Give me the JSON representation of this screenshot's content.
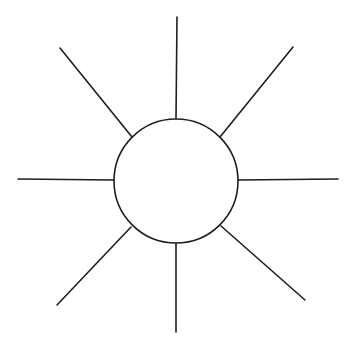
{
  "canvas": {
    "width": 348,
    "height": 350,
    "background_color": "#ffffff",
    "stroke_color": "#1f1f1f",
    "stroke_width": 1.6,
    "title": "Sun symbol line drawing"
  },
  "figure": {
    "name": "sun",
    "ray_count": 8
  },
  "chart_data": {
    "type": "scatter",
    "subtitle": "",
    "xlabel": "",
    "ylabel": "",
    "xlim": [
      0,
      348
    ],
    "ylim": [
      0,
      350
    ],
    "grid": false,
    "legend": "none",
    "circle": {
      "cx": 176,
      "cy": 181,
      "r": 62,
      "fill": "#ffffff",
      "stroke": "#1f1f1f"
    },
    "rays": [
      {
        "name": "ray-n",
        "angle_deg": 90,
        "x1": 176,
        "y1": 119,
        "x2": 177,
        "y2": 17
      },
      {
        "name": "ray-ne",
        "angle_deg": 45,
        "x1": 220,
        "y1": 137,
        "x2": 293,
        "y2": 47
      },
      {
        "name": "ray-e",
        "angle_deg": 0,
        "x1": 238,
        "y1": 180,
        "x2": 338,
        "y2": 179
      },
      {
        "name": "ray-se",
        "angle_deg": -45,
        "x1": 221,
        "y1": 226,
        "x2": 305,
        "y2": 300
      },
      {
        "name": "ray-s",
        "angle_deg": -90,
        "x1": 176,
        "y1": 243,
        "x2": 176,
        "y2": 332
      },
      {
        "name": "ray-sw",
        "angle_deg": -135,
        "x1": 131,
        "y1": 227,
        "x2": 57,
        "y2": 305
      },
      {
        "name": "ray-w",
        "angle_deg": 180,
        "x1": 114,
        "y1": 180,
        "x2": 18,
        "y2": 179
      },
      {
        "name": "ray-nw",
        "angle_deg": 135,
        "x1": 132,
        "y1": 137,
        "x2": 60,
        "y2": 48
      }
    ]
  }
}
